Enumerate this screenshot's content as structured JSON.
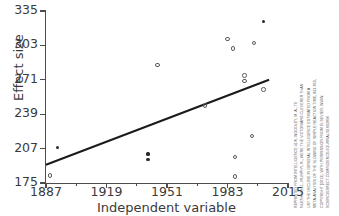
{
  "chart_data": {
    "type": "scatter",
    "title": "",
    "xlabel": "Independent variable",
    "ylabel": "Effect size",
    "xlim": [
      1887,
      2015
    ],
    "ylim": [
      175,
      335
    ],
    "xticks": [
      1887,
      1919,
      1951,
      1983,
      2015
    ],
    "yticks": [
      175,
      207,
      239,
      271,
      303,
      335
    ],
    "xtick_labels": [
      "1887",
      "1919",
      "1951",
      "1983",
      "2015"
    ],
    "ytick_labels": [
      "175",
      "207",
      "239",
      "271",
      "303",
      "335"
    ],
    "grid": false,
    "legend": false,
    "points": [
      {
        "x": 1889,
        "y": 182,
        "marker": "open"
      },
      {
        "x": 1893,
        "y": 208,
        "marker": "filled"
      },
      {
        "x": 1941,
        "y": 202,
        "marker": "filled"
      },
      {
        "x": 1941,
        "y": 197,
        "marker": "filled"
      },
      {
        "x": 1946,
        "y": 285,
        "marker": "open"
      },
      {
        "x": 1971,
        "y": 247,
        "marker": "open"
      },
      {
        "x": 1983,
        "y": 309,
        "marker": "open"
      },
      {
        "x": 1986,
        "y": 300,
        "marker": "open"
      },
      {
        "x": 1987,
        "y": 181,
        "marker": "open"
      },
      {
        "x": 1987,
        "y": 199,
        "marker": "open"
      },
      {
        "x": 1992,
        "y": 275,
        "marker": "open"
      },
      {
        "x": 1992,
        "y": 270,
        "marker": "open"
      },
      {
        "x": 1996,
        "y": 219,
        "marker": "open"
      },
      {
        "x": 1997,
        "y": 305,
        "marker": "open"
      },
      {
        "x": 2002,
        "y": 262,
        "marker": "open"
      },
      {
        "x": 2002,
        "y": 325,
        "marker": "filled"
      }
    ],
    "trendline": {
      "x_start": 1887,
      "y_start": 192,
      "x_end": 2005,
      "y_end": 271,
      "color": "#1a1a1a"
    },
    "marker_color": "#5c5c5c",
    "axis_color": "#4d4d4d"
  },
  "credit": {
    "lines": [
      "REPRINTED FROM INTELLIGENCE 41/6, WOODLEY, M. A., TE",
      "NIJENHUIS, J., MURPHY, R., WERE THE VICTORIANS CLEVERER THAN",
      "US? THE DECLINE IN GENERAL INTELLIGENCE ESTIMATED FROM A",
      "META-ANALYSIS OF THE SLOWING OF SIMPLE REACTION TIME, 843-850,",
      "COPYRIGHT (2013), WITH PERMISSION FROM ELSEVIER. WWW.",
      "SCIENCEDIRECT.COM/SCIENCE/JOURNAL/01602896"
    ]
  }
}
